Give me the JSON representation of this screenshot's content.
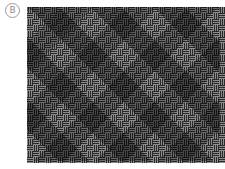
{
  "label": {
    "text": "B"
  },
  "pattern": {
    "type": "basketweave",
    "block_size_px": 6,
    "stripes_per_block": 3,
    "background_color": "#262626",
    "stripe_color": "#8c8c8c",
    "width_px": 193,
    "height_px": 154
  }
}
